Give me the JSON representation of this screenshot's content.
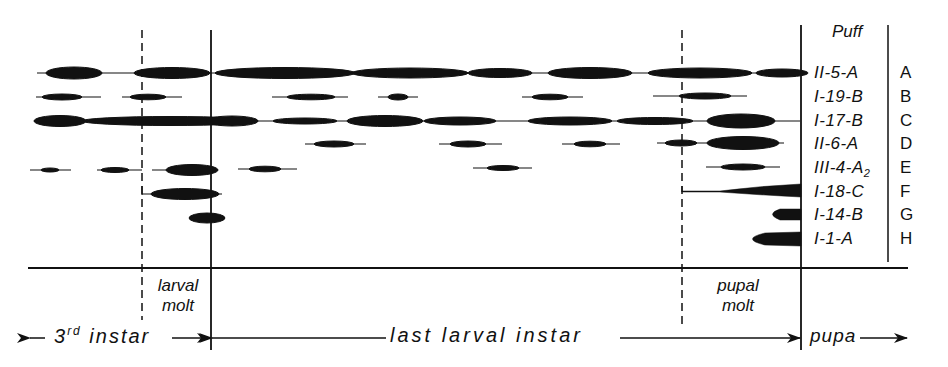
{
  "header": {
    "column_title": "Puff"
  },
  "puffs": [
    {
      "letter": "A",
      "name": "II-5-A"
    },
    {
      "letter": "B",
      "name": "I-19-B"
    },
    {
      "letter": "C",
      "name": "I-17-B"
    },
    {
      "letter": "D",
      "name": "II-6-A"
    },
    {
      "letter": "E",
      "name": "III-4-A",
      "subscript": "2"
    },
    {
      "letter": "F",
      "name": "I-18-C"
    },
    {
      "letter": "G",
      "name": "I-14-B"
    },
    {
      "letter": "H",
      "name": "I-1-A"
    }
  ],
  "molts": {
    "larval": {
      "line1": "larval",
      "line2": "molt"
    },
    "pupal": {
      "line1": "pupal",
      "line2": "molt"
    }
  },
  "stages": {
    "third_instar": {
      "prefix": "3",
      "sup": "rd",
      "suffix": " instar"
    },
    "last_larval_instar": "last larval instar",
    "pupa": "pupa"
  },
  "colors": {
    "ink": "#111111",
    "background": "#ffffff"
  }
}
